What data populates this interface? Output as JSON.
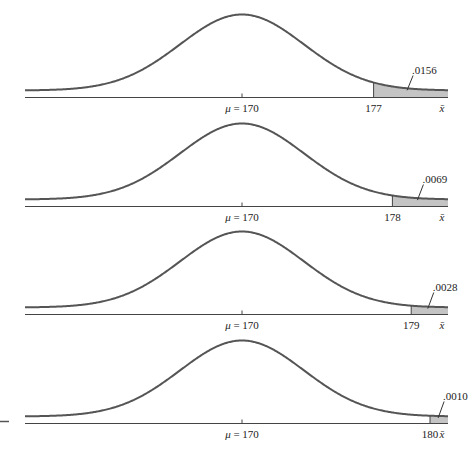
{
  "chart_data": {
    "type": "area",
    "title": "",
    "mean": 170,
    "mean_label": "μ = 170",
    "x_symbol": "x̄",
    "xlabel": "x̄",
    "ylabel": "",
    "grid": false,
    "panels": [
      {
        "cutoff": 177,
        "cutoff_label": "177",
        "tail_probability": 0.0156,
        "tail_label": ".0156"
      },
      {
        "cutoff": 178,
        "cutoff_label": "178",
        "tail_probability": 0.0069,
        "tail_label": ".0069"
      },
      {
        "cutoff": 179,
        "cutoff_label": "179",
        "tail_probability": 0.0028,
        "tail_label": ".0028"
      },
      {
        "cutoff": 180,
        "cutoff_label": "180",
        "tail_probability": 0.001,
        "tail_label": ".0010"
      }
    ]
  },
  "colors": {
    "curve": "#555555",
    "shade": "#c4c4c4",
    "axis": "#444444"
  }
}
